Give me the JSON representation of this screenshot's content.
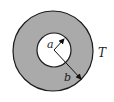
{
  "diagram": {
    "type": "annulus",
    "labels": {
      "inner_radius": "a",
      "outer_radius": "b",
      "region": "T"
    },
    "colors": {
      "ring_fill": "#aaaaaa",
      "stroke": "#1a1a1a",
      "inner_fill": "#ffffff"
    }
  }
}
